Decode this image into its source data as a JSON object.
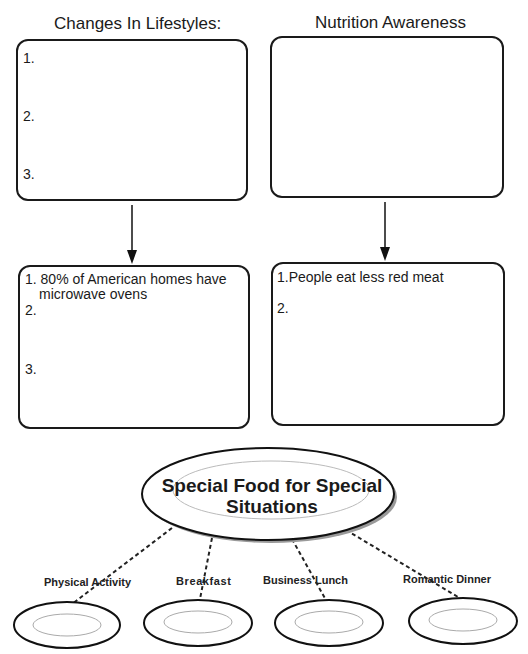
{
  "left_column": {
    "title": "Changes In Lifestyles:",
    "top_box": {
      "items": [
        "1.",
        "2.",
        "3."
      ]
    },
    "bottom_box": {
      "item1_line1": "1. 80% of American homes have",
      "item1_line2": "microwave ovens",
      "item2": "2.",
      "item3": "3."
    }
  },
  "right_column": {
    "title": "Nutrition Awareness",
    "top_box": {
      "items": []
    },
    "bottom_box": {
      "item1": "1.People eat less red meat",
      "item2": "2."
    }
  },
  "web": {
    "center_line1": "Special Food for Special",
    "center_line2": "Situations",
    "plates": [
      {
        "label": "Physical Activity"
      },
      {
        "label": "Breakfast"
      },
      {
        "label": "Business Lunch"
      },
      {
        "label": "Romantic Dinner"
      }
    ]
  }
}
